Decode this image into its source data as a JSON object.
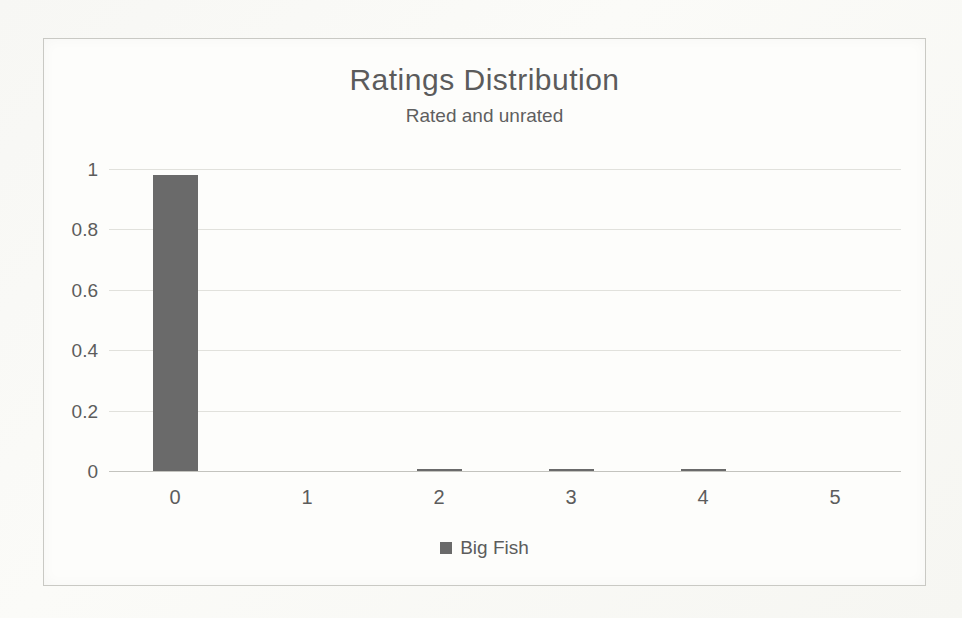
{
  "chart_data": {
    "type": "bar",
    "title": "Ratings Distribution",
    "subtitle": "Rated and unrated",
    "categories": [
      "0",
      "1",
      "2",
      "3",
      "4",
      "5"
    ],
    "series": [
      {
        "name": "Big Fish",
        "values": [
          0.98,
          0,
          0.005,
          0.005,
          0.003,
          0
        ]
      }
    ],
    "y_ticks": [
      "0",
      "0.2",
      "0.4",
      "0.6",
      "0.8",
      "1"
    ],
    "y_tick_values": [
      0,
      0.2,
      0.4,
      0.6,
      0.8,
      1
    ],
    "ylim": [
      0,
      1
    ],
    "xlabel": "",
    "ylabel": "",
    "grid": true,
    "legend_position": "bottom",
    "colors": {
      "bar": "#6a6a6a",
      "text": "#5c5c5c",
      "gridline": "#e1e1dc",
      "axis_line": "#c3c3be",
      "chart_border": "#c9c9c4"
    }
  }
}
